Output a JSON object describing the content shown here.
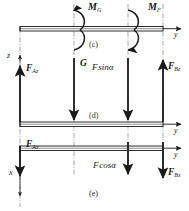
{
  "figure": {
    "type": "free-body-diagram",
    "background": "#ffffff",
    "line_color": "#1a1a1a"
  },
  "panels": [
    {
      "id": "c",
      "caption": "(c)",
      "axis_horizontal": "y",
      "axis_vertical": "z",
      "moments": [
        {
          "label": "M",
          "sub": "G",
          "sense": "counterclockwise",
          "station": "G"
        },
        {
          "label": "M",
          "sub": "F",
          "sense": "clockwise",
          "station": "F"
        }
      ]
    },
    {
      "id": "d",
      "caption": "(d)",
      "axis_horizontal": "y",
      "axis_vertical": "z",
      "forces": [
        {
          "label": "F",
          "sub": "Az",
          "direction": "up",
          "station": "A"
        },
        {
          "label": "G",
          "sub": "",
          "direction": "down",
          "station": "G"
        },
        {
          "label": "F sinα",
          "sub": "",
          "direction": "down",
          "station": "F"
        },
        {
          "label": "F",
          "sub": "Bz",
          "direction": "up",
          "station": "B"
        }
      ]
    },
    {
      "id": "e",
      "caption": "(e)",
      "axis_horizontal": "y",
      "axis_vertical": "x",
      "forces": [
        {
          "label": "F",
          "sub": "Ax",
          "direction": "down",
          "station": "A"
        },
        {
          "label": "F cosα",
          "sub": "",
          "direction": "down",
          "station": "F"
        },
        {
          "label": "F",
          "sub": "Bx",
          "direction": "down",
          "station": "B"
        }
      ]
    }
  ],
  "labels": {
    "m_g": "M",
    "m_g_sub": "G",
    "m_f": "M",
    "m_f_sub": "F",
    "f_az": "F",
    "f_az_sub": "Az",
    "g": "G",
    "fsina": "F sinα",
    "f_bz": "F",
    "f_bz_sub": "Bz",
    "f_ax": "F",
    "f_ax_sub": "Ax",
    "fcosa": "F cosα",
    "f_bx": "F",
    "f_bx_sub": "Bx",
    "axis_y_top": "y",
    "axis_y_mid": "y",
    "axis_y_bot": "y",
    "axis_z": "z",
    "axis_x": "x",
    "caption_c": "(c)",
    "caption_d": "(d)",
    "caption_e": "(e)"
  }
}
